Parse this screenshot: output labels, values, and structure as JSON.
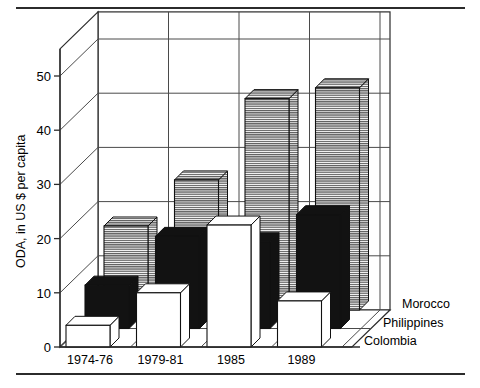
{
  "figure": {
    "has_top_rule": true,
    "has_bottom_rule": true,
    "rule_color": "#2b2b2b"
  },
  "chart_data": {
    "type": "bar",
    "title": "",
    "subtitle": "",
    "xlabel": "",
    "ylabel": "ODA, in US $ per capita",
    "categories": [
      "1974-76",
      "1979-81",
      "1985",
      "1989"
    ],
    "series": [
      {
        "name": "Morocco",
        "values": [
          15.5,
          24.0,
          39.0,
          41.0
        ],
        "fill": "horizontal-hatch",
        "color": "#4d4d4d",
        "depth_row": 0
      },
      {
        "name": "Philippines",
        "values": [
          8.0,
          17.0,
          16.0,
          21.0
        ],
        "fill": "solid",
        "color": "#121212",
        "depth_row": 1
      },
      {
        "name": "Colombia",
        "values": [
          4.0,
          10.0,
          22.5,
          8.5
        ],
        "fill": "empty",
        "color": "#ffffff",
        "depth_row": 2
      }
    ],
    "ylim": [
      0,
      55
    ],
    "yticks": [
      0,
      10,
      20,
      30,
      40,
      50
    ],
    "ytick_labels": [
      "0",
      "10",
      "20",
      "30",
      "40",
      "50"
    ],
    "grid": true,
    "grid_axis": "y",
    "projection": "3d-bar",
    "legend_position": "right-floor",
    "legend_entries": [
      "Morocco",
      "Philippines",
      "Colombia"
    ]
  },
  "axis": {
    "y_title": "ODA, in US $ per capita",
    "ticks": [
      "50",
      "40",
      "30",
      "20",
      "10",
      "0"
    ]
  },
  "legend": {
    "items": [
      "Morocco",
      "Philippines",
      "Colombia"
    ]
  },
  "categories": {
    "labels": [
      "1974-76",
      "1979-81",
      "1985",
      "1989"
    ]
  }
}
